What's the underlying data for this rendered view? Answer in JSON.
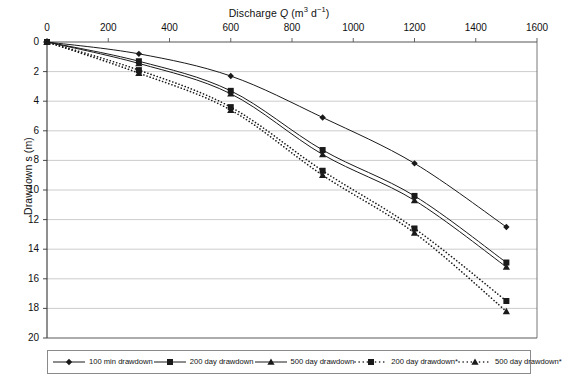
{
  "chart_data": {
    "type": "line",
    "title": "",
    "xlabel": "Discharge Q (m³ d⁻¹)",
    "ylabel": "Drawdown s (m)",
    "xlim": [
      0,
      1600
    ],
    "ylim": [
      0,
      20
    ],
    "y_inverted": true,
    "grid": "horizontal",
    "legend_position": "bottom",
    "x_ticks": [
      0,
      200,
      400,
      600,
      800,
      1000,
      1200,
      1400,
      1600
    ],
    "y_ticks": [
      0,
      2,
      4,
      6,
      8,
      10,
      12,
      14,
      16,
      18,
      20
    ],
    "x": [
      0,
      300,
      600,
      900,
      1200,
      1500
    ],
    "series": [
      {
        "name": "100 min drawdown",
        "marker": "diamond",
        "linestyle": "solid",
        "values": [
          0,
          0.8,
          2.3,
          5.1,
          8.2,
          12.5
        ]
      },
      {
        "name": "200 day drawdown",
        "marker": "square",
        "linestyle": "solid",
        "values": [
          0,
          1.3,
          3.3,
          7.3,
          10.4,
          14.9
        ]
      },
      {
        "name": "500 day drawdown",
        "marker": "triangle",
        "linestyle": "solid",
        "values": [
          0,
          1.45,
          3.5,
          7.6,
          10.7,
          15.2
        ]
      },
      {
        "name": "200 day drawdown*",
        "marker": "square",
        "linestyle": "dotted",
        "values": [
          0,
          1.9,
          4.4,
          8.7,
          12.6,
          17.5
        ]
      },
      {
        "name": "500 day drawdown*",
        "marker": "triangle",
        "linestyle": "dotted",
        "values": [
          0,
          2.1,
          4.6,
          9.0,
          12.9,
          18.2
        ]
      }
    ]
  },
  "axes": {
    "x_title_pre": "Discharge ",
    "x_title_var": "Q",
    "x_title_unit_m": " (m",
    "x_title_unit_m_sup": "3",
    "x_title_unit_d": " d",
    "x_title_unit_d_sup": "−1",
    "x_title_close": ")",
    "y_title": "Drawdown s (m)"
  },
  "legend": {
    "entries": [
      {
        "label": "100 min drawdown",
        "marker": "diamond-marker",
        "style": "solid"
      },
      {
        "label": "200 day drawdown",
        "marker": "square-marker",
        "style": "solid"
      },
      {
        "label": "500 day drawdown",
        "marker": "triangle-marker",
        "style": "solid"
      },
      {
        "label": "200 day drawdown*",
        "marker": "square-marker",
        "style": "dotted"
      },
      {
        "label": "500 day drawdown*",
        "marker": "triangle-marker",
        "style": "dotted"
      }
    ]
  },
  "colors": {
    "line": "#1a1a1a",
    "grid": "#bfbfbf",
    "axis": "#555555",
    "background": "#ffffff"
  }
}
